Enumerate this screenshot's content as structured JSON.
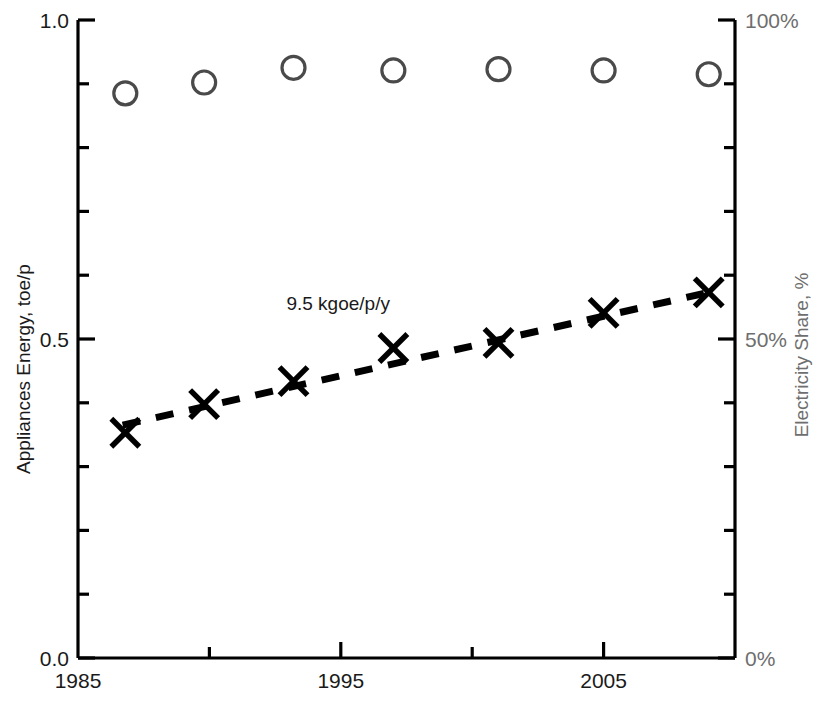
{
  "chart_data": {
    "type": "scatter",
    "title": "",
    "xlabel": "",
    "ylabel": "Appliances Energy, toe/p",
    "y2label": "Electricity Share, %",
    "xlim": [
      1985,
      2010
    ],
    "ylim": [
      0.0,
      1.0
    ],
    "y2lim": [
      0,
      100
    ],
    "grid": false,
    "legend": "none",
    "x_ticks_major": [
      1985,
      1995,
      2005
    ],
    "x_tick_labels": [
      "1985",
      "1995",
      "2005"
    ],
    "x_ticks_minor": [
      1990,
      2000,
      2010
    ],
    "y_ticks_major": [
      0.0,
      0.5,
      1.0
    ],
    "y_tick_labels": [
      "0.0",
      "0.5",
      "1.0"
    ],
    "y_ticks_minor": [
      0.1,
      0.2,
      0.3,
      0.4,
      0.6,
      0.7,
      0.8,
      0.9
    ],
    "y2_ticks_major": [
      0,
      50,
      100
    ],
    "y2_tick_labels": [
      "0%",
      "50%",
      "100%"
    ],
    "y2_ticks_minor": [
      10,
      20,
      30,
      40,
      60,
      70,
      80,
      90
    ],
    "series": [
      {
        "name": "Electricity Share",
        "marker": "circle",
        "axis": "right",
        "color": "#4a4a4a",
        "x": [
          1986.8,
          1989.8,
          1993.2,
          1997.0,
          2001.0,
          2005.0,
          2009.0
        ],
        "values": [
          88.5,
          90.2,
          92.5,
          92.1,
          92.3,
          92.1,
          91.5
        ]
      },
      {
        "name": "Appliances Energy",
        "marker": "x",
        "axis": "left",
        "color": "#000000",
        "x": [
          1986.8,
          1989.8,
          1993.2,
          1997.0,
          2001.0,
          2005.0,
          2009.0
        ],
        "values": [
          0.353,
          0.398,
          0.434,
          0.486,
          0.494,
          0.541,
          0.573
        ]
      }
    ],
    "trend": {
      "name": "trend-line",
      "style": "dashed",
      "color": "#000000",
      "x": [
        1986.7,
        2009.1
      ],
      "values": [
        0.365,
        0.574
      ],
      "annotation": "9.5 kgoe/p/y"
    },
    "annotations": [
      {
        "text": "9.5 kgoe/p/y",
        "x": 1994.9,
        "y": 0.545
      }
    ]
  },
  "axes": {
    "left_title": "Appliances Energy, toe/p",
    "right_title": "Electricity Share, %",
    "left_labels": [
      "1.0",
      "0.5",
      "0.0"
    ],
    "right_labels": [
      "100%",
      "50%",
      "0%"
    ],
    "x_labels": [
      "1985",
      "1995",
      "2005"
    ]
  },
  "colors": {
    "ink": "#000000",
    "marker_circle": "#4a4a4a",
    "right_axis_text": "#6e6e6e",
    "background": "#ffffff"
  }
}
